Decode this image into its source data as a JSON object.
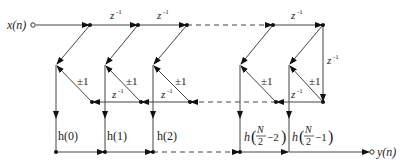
{
  "diagram": {
    "input_label": "x(n)",
    "output_label": "y(n)",
    "delay_label": "z",
    "delay_exp": "-1",
    "sign_label": "±1",
    "coefficients": [
      "h(0)",
      "h(1)",
      "h(2)"
    ],
    "coef_n2": {
      "h": "h",
      "N": "N",
      "den": "2",
      "tail": "−2"
    },
    "coef_n1": {
      "h": "h",
      "N": "N",
      "den": "2",
      "tail": "−1"
    },
    "colors": {
      "line": "#333333",
      "node": "#111111",
      "text": "#222222"
    }
  }
}
